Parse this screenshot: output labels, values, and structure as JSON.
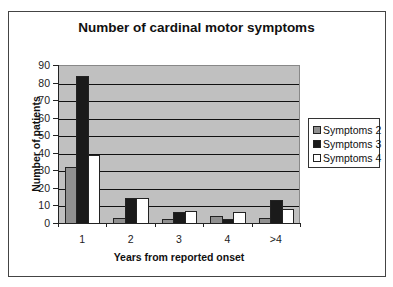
{
  "chart_data": {
    "type": "bar",
    "title": "Number of cardinal motor symptoms",
    "xlabel": "Years from reported onset",
    "ylabel": "Number of patients",
    "categories": [
      "1",
      "2",
      "3",
      "4",
      ">4"
    ],
    "series": [
      {
        "name": "Symptoms 2",
        "color": "#909090",
        "values": [
          32,
          3,
          2,
          4,
          3
        ]
      },
      {
        "name": "Symptoms 3",
        "color": "#1a1a1a",
        "values": [
          84,
          14,
          6,
          2,
          13
        ]
      },
      {
        "name": "Symptoms 4",
        "color": "#ffffff",
        "values": [
          39,
          14,
          7,
          6,
          8
        ]
      }
    ],
    "ylim": [
      0,
      90
    ],
    "yticks": [
      0,
      10,
      20,
      30,
      40,
      50,
      60,
      70,
      80,
      90
    ],
    "grid": true,
    "plot_background": "#c0c0c0",
    "legend_position": "right"
  }
}
